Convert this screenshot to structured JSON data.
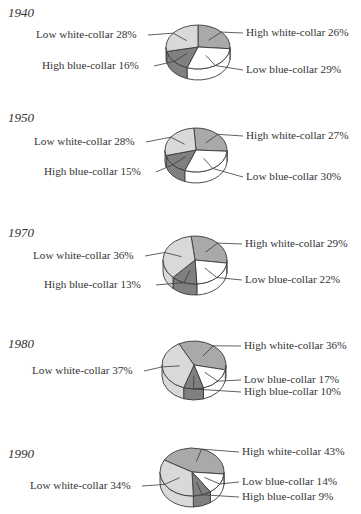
{
  "chart_data": [
    {
      "type": "pie",
      "title": "1940",
      "categories": [
        "High white-collar",
        "Low blue-collar",
        "High blue-collar",
        "Low white-collar"
      ],
      "values": [
        26,
        29,
        16,
        28
      ],
      "labels": [
        "High white-collar 26%",
        "Low blue-collar 29%",
        "High blue-collar 16%",
        "Low white-collar 28%"
      ]
    },
    {
      "type": "pie",
      "title": "1950",
      "categories": [
        "High white-collar",
        "Low blue-collar",
        "High blue-collar",
        "Low white-collar"
      ],
      "values": [
        27,
        30,
        15,
        28
      ],
      "labels": [
        "High white-collar 27%",
        "Low blue-collar 30%",
        "High blue-collar 15%",
        "Low white-collar 28%"
      ]
    },
    {
      "type": "pie",
      "title": "1970",
      "categories": [
        "High white-collar",
        "Low blue-collar",
        "High blue-collar",
        "Low white-collar"
      ],
      "values": [
        29,
        22,
        13,
        36
      ],
      "labels": [
        "High white-collar 29%",
        "Low blue-collar 22%",
        "High blue-collar 13%",
        "Low white-collar 36%"
      ]
    },
    {
      "type": "pie",
      "title": "1980",
      "categories": [
        "High white-collar",
        "Low blue-collar",
        "High blue-collar",
        "Low white-collar"
      ],
      "values": [
        36,
        17,
        10,
        37
      ],
      "labels": [
        "High white-collar 36%",
        "Low blue-collar 17%",
        "High blue-collar 10%",
        "Low white-collar 37%"
      ]
    },
    {
      "type": "pie",
      "title": "1990",
      "categories": [
        "High white-collar",
        "Low blue-collar",
        "High blue-collar",
        "Low white-collar"
      ],
      "values": [
        43,
        14,
        9,
        34
      ],
      "labels": [
        "High white-collar 43%",
        "Low blue-collar 14%",
        "High blue-collar 9%",
        "Low white-collar 34%"
      ]
    }
  ],
  "colors": {
    "High white-collar": "#a9a9a9",
    "Low blue-collar": "#ffffff",
    "High blue-collar": "#808080",
    "Low white-collar": "#d9d9d9",
    "outline": "#3a3a3a"
  },
  "layout": [
    {
      "top": 0,
      "cx": 198,
      "cy": 47,
      "rx": 32,
      "ry": 22,
      "depth": 11,
      "start": -90,
      "label_pos": {
        "High white-collar": [
          246,
          33,
          "right"
        ],
        "Low blue-collar": [
          246,
          70,
          "right"
        ],
        "High blue-collar": [
          42,
          66,
          "left"
        ],
        "Low white-collar": [
          36,
          35,
          "left"
        ]
      }
    },
    {
      "top": 100,
      "cx": 196,
      "cy": 50,
      "rx": 31,
      "ry": 22,
      "depth": 11,
      "start": -94,
      "label_pos": {
        "High white-collar": [
          246,
          36,
          "right"
        ],
        "Low blue-collar": [
          246,
          77,
          "right"
        ],
        "High blue-collar": [
          44,
          72,
          "left"
        ],
        "Low white-collar": [
          34,
          42,
          "left"
        ]
      }
    },
    {
      "top": 200,
      "cx": 195,
      "cy": 60,
      "rx": 32,
      "ry": 24,
      "depth": 11,
      "start": -97,
      "label_pos": {
        "High white-collar": [
          245,
          44,
          "right"
        ],
        "Low blue-collar": [
          245,
          80,
          "right"
        ],
        "High blue-collar": [
          44,
          85,
          "left"
        ],
        "Low white-collar": [
          33,
          56,
          "left"
        ]
      }
    },
    {
      "top": 310,
      "cx": 194,
      "cy": 55,
      "rx": 32,
      "ry": 24,
      "depth": 11,
      "start": -118,
      "label_pos": {
        "High white-collar": [
          244,
          36,
          "right"
        ],
        "Low blue-collar": [
          244,
          70,
          "right"
        ],
        "High blue-collar": [
          244,
          82,
          "right"
        ],
        "Low white-collar": [
          32,
          61,
          "left"
        ]
      }
    },
    {
      "top": 410,
      "cx": 192,
      "cy": 62,
      "rx": 32,
      "ry": 24,
      "depth": 11,
      "start": -150,
      "label_pos": {
        "High white-collar": [
          242,
          42,
          "right"
        ],
        "Low blue-collar": [
          242,
          72,
          "right"
        ],
        "High blue-collar": [
          242,
          87,
          "right"
        ],
        "Low white-collar": [
          30,
          76,
          "left"
        ]
      }
    }
  ]
}
